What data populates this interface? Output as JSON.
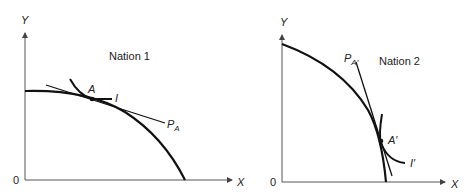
{
  "panels": [
    {
      "id": "nation1",
      "title": "Nation 1",
      "axis_x_label": "X",
      "axis_y_label": "Y",
      "origin_label": "0",
      "point_label": "A",
      "indifference_label": "I",
      "price_line_label_main": "P",
      "price_line_label_sub": "A"
    },
    {
      "id": "nation2",
      "title": "Nation 2",
      "axis_x_label": "X",
      "axis_y_label": "Y",
      "origin_label": "0",
      "point_label": "A′",
      "indifference_label": "I′",
      "price_line_label_main": "P",
      "price_line_label_sub": "A′"
    }
  ],
  "colors": {
    "axis": "#555555",
    "curve": "#111111",
    "text": "#222222"
  }
}
